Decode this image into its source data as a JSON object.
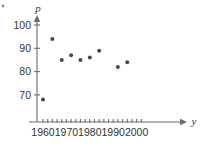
{
  "chart_data": {
    "type": "scatter",
    "title": "",
    "xlabel": "y",
    "ylabel": "p",
    "xlim": [
      1954,
      2004
    ],
    "ylim": [
      63,
      103
    ],
    "grid": false,
    "legend": null,
    "x_ticks_major": [
      1960,
      1970,
      1980,
      1990,
      2000
    ],
    "x_tick_labels": [
      "1960",
      "1970",
      "1980",
      "1990",
      "2000"
    ],
    "x_tick_step_minor": 2,
    "y_ticks": [
      70,
      80,
      90,
      100
    ],
    "y_tick_labels": [
      "70",
      "80",
      "90",
      "100"
    ],
    "points": [
      {
        "x": 1960,
        "y": 68
      },
      {
        "x": 1964,
        "y": 94
      },
      {
        "x": 1968,
        "y": 85
      },
      {
        "x": 1972,
        "y": 87
      },
      {
        "x": 1976,
        "y": 85
      },
      {
        "x": 1980,
        "y": 86
      },
      {
        "x": 1984,
        "y": 89
      },
      {
        "x": 1992,
        "y": 82
      },
      {
        "x": 1996,
        "y": 84
      }
    ],
    "colors": {
      "point": "#4a4a4a",
      "axis": "#6b6b6b",
      "text": "#333333",
      "background": "#ffffff"
    }
  },
  "axis_labels": {
    "y_axis_name": "p",
    "x_axis_name": "y"
  }
}
